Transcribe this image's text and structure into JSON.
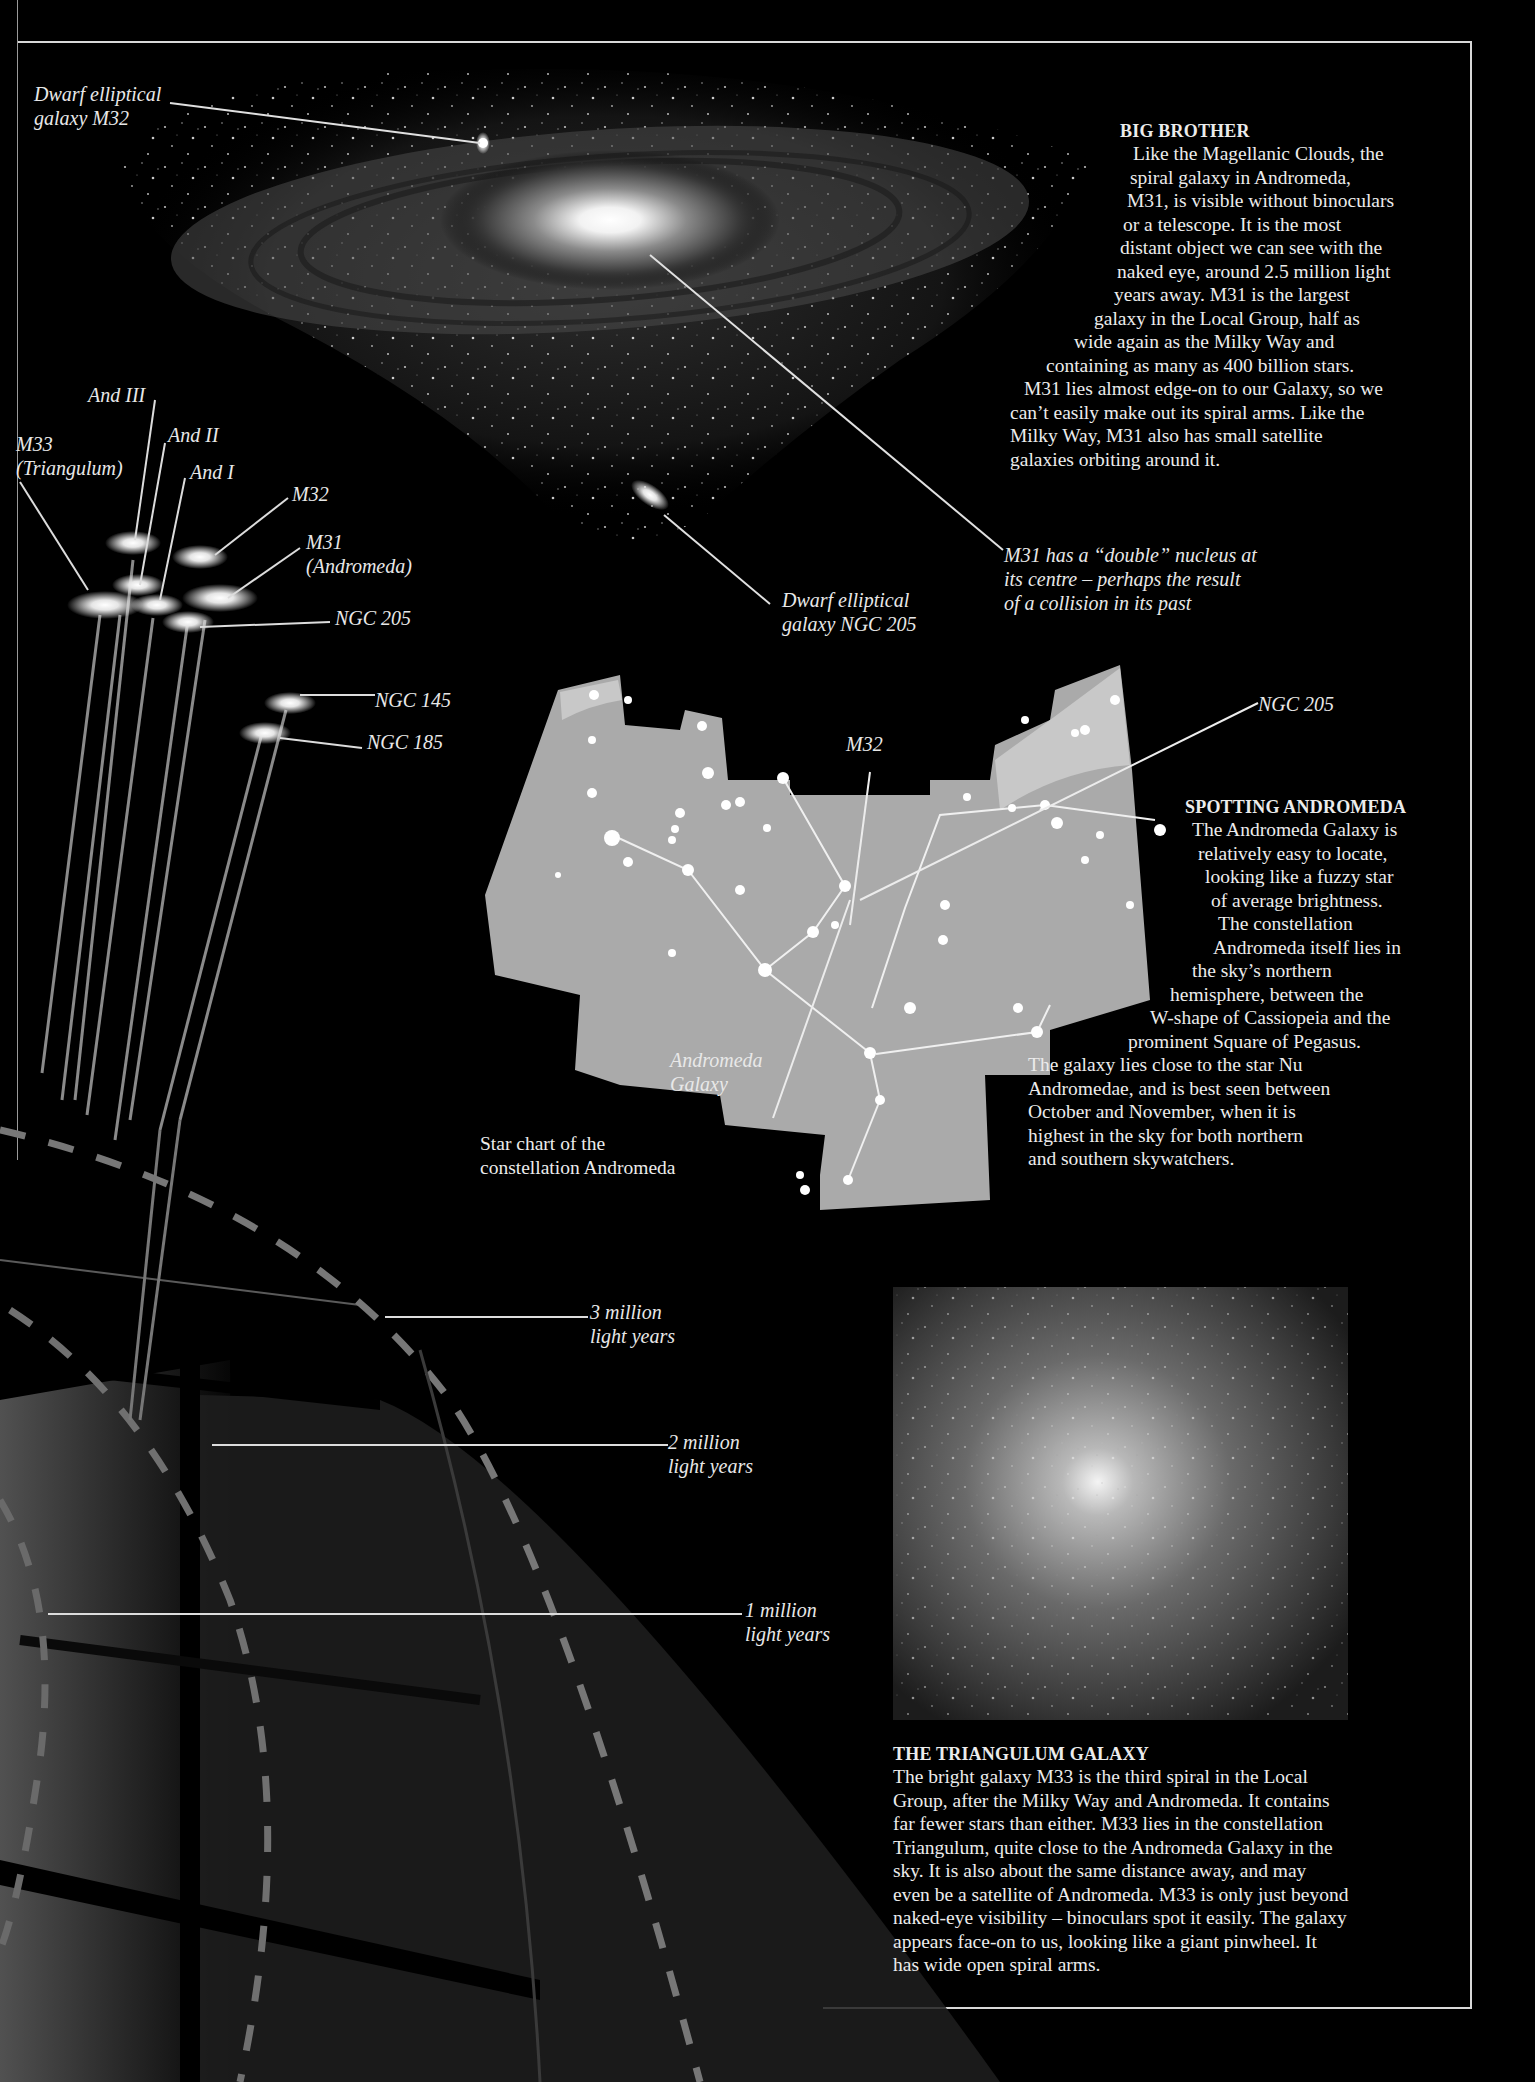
{
  "colors": {
    "background": "#000000",
    "text": "#ececec",
    "frame": "#d8d8d8",
    "chart_fill": "#a9a9a9",
    "chart_light": "#c6c6c6",
    "dashed_ring": "#7a7a7a"
  },
  "andromeda_photo": {
    "callouts": {
      "m32_top": [
        "Dwarf elliptical",
        "galaxy M32"
      ],
      "ngc205_photo": [
        "Dwarf elliptical",
        "galaxy NGC 205"
      ],
      "nucleus": [
        "M31 has a “double” nucleus at",
        "its centre –  perhaps the result",
        "of a collision in its past"
      ]
    }
  },
  "big_brother": {
    "heading": "BIG BROTHER",
    "lines": [
      "Like the Magellanic Clouds, the",
      "spiral galaxy in Andromeda,",
      "M31, is visible without binoculars",
      "or a telescope. It is the most",
      "distant object we can see with the",
      "naked eye, around 2.5 million light",
      "years away. M31 is the largest",
      "galaxy in the Local Group, half as",
      "wide again as the Milky Way and",
      "containing as many as 400 billion stars.",
      "M31 lies almost edge-on to our Galaxy, so we",
      "can’t easily make out its spiral arms. Like the",
      "Milky Way, M31 also has small satellite",
      "galaxies orbiting around it."
    ]
  },
  "local_group_diagram": {
    "galaxy_labels": {
      "and3": "And III",
      "m33": [
        "M33",
        "(Triangulum)"
      ],
      "and2": "And II",
      "and1": "And I",
      "m32": "M32",
      "m31": [
        "M31",
        "(Andromeda)"
      ],
      "ngc205": "NGC 205",
      "ngc145": "NGC 145",
      "ngc185": "NGC 185"
    },
    "distance_labels": [
      [
        "3 million",
        "light years"
      ],
      [
        "2 million",
        "light years"
      ],
      [
        "1 million",
        "light years"
      ]
    ]
  },
  "star_chart": {
    "caption": [
      "Star chart of the",
      "constellation Andromeda"
    ],
    "labels": {
      "m32": "M32",
      "ngc205": "NGC 205",
      "andromeda_galaxy": [
        "Andromeda",
        "Galaxy"
      ]
    }
  },
  "spotting_andromeda": {
    "heading": "SPOTTING ANDROMEDA",
    "lines": [
      "The Andromeda Galaxy is",
      "relatively easy to locate,",
      "looking like a fuzzy star",
      "of average brightness.",
      "The constellation",
      "Andromeda itself lies in",
      "the sky’s northern",
      "hemisphere, between the",
      "W-shape of Cassiopeia and the",
      "prominent Square of Pegasus.",
      "The galaxy lies close to the star Nu",
      "Andromedae, and is best seen between",
      "October and November, when it is",
      "highest in the sky for both northern",
      "and southern skywatchers."
    ]
  },
  "triangulum": {
    "heading": "THE TRIANGULUM GALAXY",
    "lines": [
      "The bright galaxy M33 is the third spiral in the Local",
      "Group, after the Milky Way and Andromeda. It contains",
      "far fewer stars than either. M33 lies in the constellation",
      "Triangulum, quite close to the Andromeda Galaxy in the",
      "sky. It is also about the same distance away, and may",
      "even be a satellite of Andromeda. M33 is only just beyond",
      "naked-eye visibility – binoculars spot it easily. The galaxy",
      "appears face-on to us, looking like a giant pinwheel. It",
      "has wide open spiral arms."
    ]
  }
}
